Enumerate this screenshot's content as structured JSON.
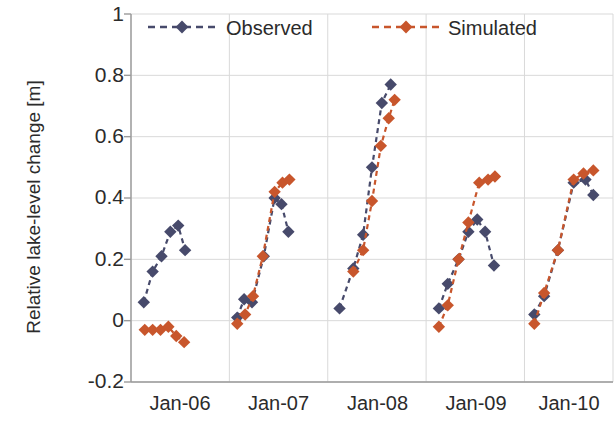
{
  "chart_data": {
    "type": "scatter",
    "title": "",
    "xlabel": "",
    "ylabel": "Relative lake-level change [m]",
    "ylim": [
      -0.2,
      1.0
    ],
    "yticks": [
      "1",
      "0.8",
      "0.6",
      "0.4",
      "0.2",
      "0",
      "-0.2"
    ],
    "ytick_values": [
      1,
      0.8,
      0.6,
      0.4,
      0.2,
      0,
      -0.2
    ],
    "xticks": [
      "Jan-06",
      "Jan-07",
      "Jan-08",
      "Jan-09",
      "Jan-10"
    ],
    "xtick_values": [
      2006.0,
      2007.0,
      2008.0,
      2009.0,
      2010.0
    ],
    "xlim": [
      2006.0,
      2010.9
    ],
    "grid": true,
    "grid_color": "#d9d9d9",
    "legend_position": "top-center-inside",
    "colors": {
      "observed": "#474a6b",
      "simulated": "#c8562c",
      "axis": "#808080",
      "text": "#2b2b2b"
    },
    "marker": "diamond",
    "linestyle": "dashed",
    "series": [
      {
        "name": "Observed",
        "color": "#474a6b",
        "groups": [
          {
            "year": 2006,
            "x": [
              2006.13,
              2006.22,
              2006.31,
              2006.4,
              2006.48,
              2006.55
            ],
            "y": [
              0.06,
              0.16,
              0.21,
              0.29,
              0.31,
              0.23
            ]
          },
          {
            "year": 2007,
            "x": [
              2007.08,
              2007.15,
              2007.23,
              2007.35,
              2007.46,
              2007.53,
              2007.6
            ],
            "y": [
              0.01,
              0.07,
              0.06,
              0.21,
              0.4,
              0.38,
              0.29
            ]
          },
          {
            "year": 2008,
            "x": [
              2008.12,
              2008.26,
              2008.36,
              2008.45,
              2008.55,
              2008.64
            ],
            "y": [
              0.04,
              0.17,
              0.28,
              0.5,
              0.71,
              0.77
            ]
          },
          {
            "year": 2009,
            "x": [
              2009.13,
              2009.22,
              2009.33,
              2009.43,
              2009.52,
              2009.6,
              2009.69
            ],
            "y": [
              0.04,
              0.12,
              0.2,
              0.29,
              0.33,
              0.29,
              0.18
            ]
          },
          {
            "year": 2010,
            "x": [
              2010.1,
              2010.2,
              2010.34,
              2010.5,
              2010.62,
              2010.7
            ],
            "y": [
              0.02,
              0.08,
              0.23,
              0.45,
              0.46,
              0.41
            ]
          }
        ]
      },
      {
        "name": "Simulated",
        "color": "#c8562c",
        "groups": [
          {
            "year": 2006,
            "x": [
              2006.14,
              2006.22,
              2006.3,
              2006.38,
              2006.46,
              2006.54
            ],
            "y": [
              -0.03,
              -0.03,
              -0.03,
              -0.02,
              -0.05,
              -0.07
            ]
          },
          {
            "year": 2007,
            "x": [
              2007.08,
              2007.16,
              2007.24,
              2007.34,
              2007.46,
              2007.54,
              2007.61
            ],
            "y": [
              -0.01,
              0.02,
              0.08,
              0.21,
              0.42,
              0.45,
              0.46
            ]
          },
          {
            "year": 2008,
            "x": [
              2008.26,
              2008.36,
              2008.45,
              2008.54,
              2008.62,
              2008.68
            ],
            "y": [
              0.16,
              0.23,
              0.39,
              0.57,
              0.66,
              0.72
            ]
          },
          {
            "year": 2009,
            "x": [
              2009.13,
              2009.22,
              2009.33,
              2009.43,
              2009.54,
              2009.63,
              2009.7
            ],
            "y": [
              -0.02,
              0.05,
              0.2,
              0.32,
              0.45,
              0.46,
              0.47
            ]
          },
          {
            "year": 2010,
            "x": [
              2010.1,
              2010.2,
              2010.34,
              2010.5,
              2010.6,
              2010.7
            ],
            "y": [
              -0.01,
              0.09,
              0.23,
              0.46,
              0.48,
              0.49
            ]
          }
        ]
      }
    ]
  },
  "legend": {
    "items": [
      {
        "label": "Observed",
        "color": "#474a6b"
      },
      {
        "label": "Simulated",
        "color": "#c8562c"
      }
    ]
  }
}
